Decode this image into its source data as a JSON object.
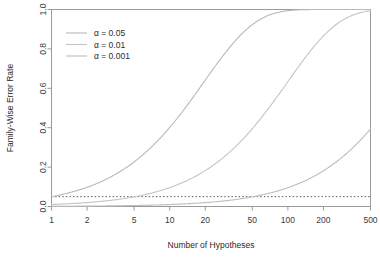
{
  "chart_data": {
    "type": "line",
    "title": "",
    "xlabel": "Number of Hypotheses",
    "ylabel": "Family-Wise Error Rate",
    "xscale": "log",
    "xlim": [
      1,
      500
    ],
    "ylim": [
      0,
      1
    ],
    "xticks": [
      1,
      2,
      5,
      10,
      20,
      50,
      100,
      200,
      500
    ],
    "xtick_labels": [
      "1",
      "2",
      "5",
      "10",
      "20",
      "50",
      "100",
      "200",
      "500"
    ],
    "yticks": [
      0.0,
      0.2,
      0.4,
      0.6,
      0.8,
      1.0
    ],
    "ytick_labels": [
      "0.0",
      "0.2",
      "0.4",
      "0.6",
      "0.8",
      "1.0"
    ],
    "grid": false,
    "legend_position": "top-left",
    "formula": "FWER = 1 - (1 - alpha)^n",
    "series": [
      {
        "name": "α = 0.05",
        "alpha": 0.05,
        "color": "#b9b9b9",
        "x": [
          1,
          2,
          3,
          5,
          7,
          10,
          14,
          20,
          30,
          45,
          60,
          80,
          100,
          140,
          200,
          300,
          400,
          500
        ],
        "values": [
          0.05,
          0.098,
          0.143,
          0.226,
          0.302,
          0.401,
          0.512,
          0.642,
          0.785,
          0.901,
          0.954,
          0.983,
          0.994,
          0.999,
          1.0,
          1.0,
          1.0,
          1.0
        ]
      },
      {
        "name": "α = 0.01",
        "alpha": 0.01,
        "color": "#c4c4c4",
        "x": [
          1,
          2,
          3,
          5,
          7,
          10,
          14,
          20,
          30,
          45,
          60,
          80,
          100,
          140,
          200,
          300,
          400,
          500
        ],
        "values": [
          0.01,
          0.02,
          0.03,
          0.049,
          0.068,
          0.096,
          0.131,
          0.182,
          0.26,
          0.363,
          0.453,
          0.552,
          0.634,
          0.756,
          0.866,
          0.951,
          0.982,
          0.993
        ]
      },
      {
        "name": "α = 0.001",
        "alpha": 0.001,
        "color": "#bdbdbd",
        "x": [
          1,
          2,
          3,
          5,
          7,
          10,
          14,
          20,
          30,
          45,
          60,
          80,
          100,
          140,
          200,
          300,
          400,
          500
        ],
        "values": [
          0.001,
          0.002,
          0.003,
          0.005,
          0.007,
          0.01,
          0.014,
          0.02,
          0.03,
          0.044,
          0.058,
          0.077,
          0.095,
          0.131,
          0.181,
          0.259,
          0.33,
          0.394
        ]
      }
    ],
    "reference_line": {
      "name": "alpha-0.05-reference",
      "y": 0.05,
      "style": "dotted",
      "color": "#555555"
    },
    "legend_entries": [
      {
        "label": "α = 0.05",
        "color": "#b9b9b9"
      },
      {
        "label": "α = 0.01",
        "color": "#c4c4c4"
      },
      {
        "label": "α = 0.001",
        "color": "#bdbdbd"
      }
    ]
  }
}
